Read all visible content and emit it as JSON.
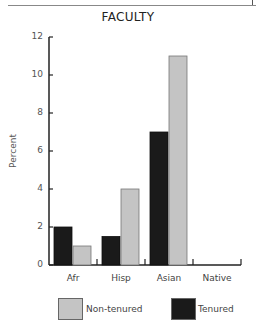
{
  "chart_data": {
    "type": "bar",
    "title": "FACULTY",
    "xlabel": "",
    "ylabel": "Percent",
    "ylim": [
      0,
      12
    ],
    "yticks": [
      0,
      2,
      4,
      6,
      8,
      10,
      12
    ],
    "grid": false,
    "legend_position": "bottom",
    "categories": [
      "Afr",
      "Hisp",
      "Asian",
      "Native"
    ],
    "series": [
      {
        "name": "Tenured",
        "color": "#1a1a1a",
        "values": [
          2,
          1.5,
          7,
          0
        ]
      },
      {
        "name": "Non-tenured",
        "color": "#c4c4c4",
        "values": [
          1,
          4,
          11,
          0
        ]
      }
    ]
  },
  "legend": {
    "non_tenured": "Non-tenured",
    "tenured": "Tenured"
  },
  "colors": {
    "tenured": "#1a1a1a",
    "non_tenured": "#c4c4c4",
    "axis": "#222222"
  }
}
